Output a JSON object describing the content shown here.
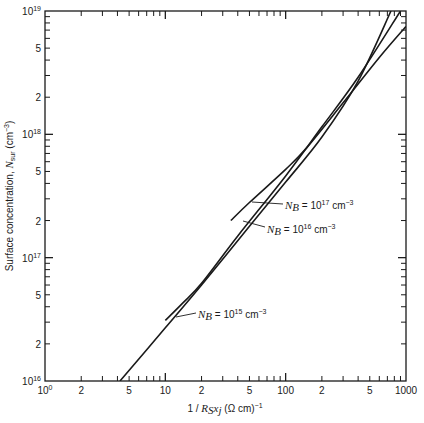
{
  "chart_data": {
    "type": "line",
    "title": "",
    "xlabel": "1 / R_S x_j (Ω cm)^-1",
    "ylabel": "Surface concentration, N_sur (cm^-3)",
    "xscale": "log",
    "yscale": "log",
    "xlim": [
      1,
      1000
    ],
    "ylim": [
      1e+16,
      1e+19
    ],
    "grid": false,
    "legend": "inline annotations",
    "x_tick_labels": [
      {
        "value": 1,
        "label": "10",
        "sup": "0"
      },
      {
        "value": 2,
        "label": "2"
      },
      {
        "value": 5,
        "label": "5"
      },
      {
        "value": 10,
        "label": "10"
      },
      {
        "value": 20,
        "label": "2"
      },
      {
        "value": 50,
        "label": "5"
      },
      {
        "value": 100,
        "label": "100"
      },
      {
        "value": 200,
        "label": "2"
      },
      {
        "value": 500,
        "label": "5"
      },
      {
        "value": 1000,
        "label": "1000"
      }
    ],
    "y_tick_labels": [
      {
        "value": 1e+16,
        "label": "10",
        "sup": "16"
      },
      {
        "value": 2e+16,
        "label": "2"
      },
      {
        "value": 5e+16,
        "label": "5"
      },
      {
        "value": 1e+17,
        "label": "10",
        "sup": "17"
      },
      {
        "value": 2e+17,
        "label": "2"
      },
      {
        "value": 5e+17,
        "label": "5"
      },
      {
        "value": 1e+18,
        "label": "10",
        "sup": "18"
      },
      {
        "value": 2e+18,
        "label": "2"
      },
      {
        "value": 5e+18,
        "label": "5"
      },
      {
        "value": 1e+19,
        "label": "10",
        "sup": "19"
      }
    ],
    "series": [
      {
        "name": "N_B = 10^15 cm^-3",
        "label_parts": {
          "pre": "N",
          "sub": "B",
          "mid": " = 10",
          "sup": "15",
          "post": " cm",
          "unit_sup": "−3"
        },
        "x": [
          10,
          14,
          20,
          40,
          100,
          200,
          400,
          900
        ],
        "y": [
          3.1e+16,
          4.3e+16,
          6.2e+16,
          1.5e+17,
          4.6e+17,
          1.15e+18,
          2.9e+18,
          1e+19
        ]
      },
      {
        "name": "N_B = 10^16 cm^-3",
        "label_parts": {
          "pre": "N",
          "sub": "B",
          "mid": " = 10",
          "sup": "16",
          "post": " cm",
          "unit_sup": "−3"
        },
        "x": [
          4.2,
          10,
          20,
          50,
          100,
          200,
          400,
          750
        ],
        "y": [
          1e+16,
          2.7e+16,
          6e+16,
          1.8e+17,
          4.1e+17,
          9.5e+17,
          2.7e+18,
          1e+19
        ]
      },
      {
        "name": "N_B = 10^17 cm^-3",
        "label_parts": {
          "pre": "N",
          "sub": "B",
          "mid": " = 10",
          "sup": "17",
          "post": " cm",
          "unit_sup": "−3"
        },
        "x": [
          35,
          50,
          100,
          150,
          300,
          600,
          1000
        ],
        "y": [
          2e+17,
          2.8e+17,
          5.2e+17,
          7.8e+17,
          1.8e+18,
          4.2e+18,
          7.5e+18
        ]
      }
    ]
  },
  "axes": {
    "x_label": {
      "pre": "1 / ",
      "R": "R",
      "Rsub": "S",
      "x": "x",
      "xsub": "j",
      "post": " (Ω cm)",
      "sup": "−1"
    },
    "y_label": {
      "pre": "Surface concentration, ",
      "N": "N",
      "Nsub": "sur",
      "post": " (cm",
      "sup": "−3",
      "close": ")"
    }
  }
}
